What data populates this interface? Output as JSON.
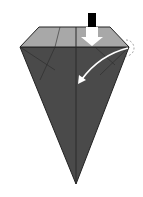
{
  "diagram": {
    "type": "origami-fold-step",
    "colors": {
      "background": "#ffffff",
      "paper_dark": "#4a4a4a",
      "paper_light": "#a8a8a8",
      "crease": "#222222",
      "arrow": "#ffffff",
      "push_bar": "#000000",
      "dashed_circle": "#888888"
    },
    "elements": [
      {
        "name": "top-flap",
        "shade": "light"
      },
      {
        "name": "body-cone",
        "shade": "dark"
      },
      {
        "name": "push-arrow",
        "meaning": "push down / sink"
      },
      {
        "name": "curved-fold-arrow",
        "meaning": "fold corner inward"
      },
      {
        "name": "dashed-circle",
        "meaning": "reference corner"
      }
    ]
  }
}
